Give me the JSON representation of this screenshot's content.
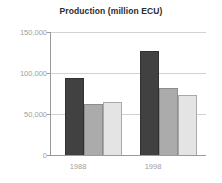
{
  "chart_data": {
    "type": "bar",
    "title": "Production (million ECU)",
    "xlabel": "",
    "ylabel": "",
    "categories": [
      "1988",
      "1998"
    ],
    "series": [
      {
        "name": "series-1",
        "color": "#414141",
        "values": [
          94000,
          127000
        ]
      },
      {
        "name": "series-2",
        "color": "#ababab",
        "values": [
          62000,
          82000
        ]
      },
      {
        "name": "series-3",
        "color": "#e4e4e4",
        "values": [
          65000,
          73000
        ]
      }
    ],
    "ylim": [
      0,
      150000
    ],
    "yticks": [
      0,
      50000,
      100000,
      150000
    ],
    "ytick_labels": [
      "0",
      "50,000",
      "100,000",
      "150,000"
    ],
    "grid": true,
    "legend": "none"
  },
  "axis": {
    "y0_label": "0",
    "y1_label": "50,000",
    "y2_label": "100,000",
    "y3_label": "150,000",
    "x0_label": "1988",
    "x1_label": "1998"
  }
}
